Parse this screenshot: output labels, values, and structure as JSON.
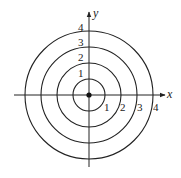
{
  "figure": {
    "axes": {
      "x_label": "x",
      "y_label": "y"
    },
    "circles": [
      {
        "radius": 1,
        "top_label": "1",
        "right_label": "1"
      },
      {
        "radius": 2,
        "top_label": "2",
        "right_label": "2"
      },
      {
        "radius": 3,
        "top_label": "3",
        "right_label": "3"
      },
      {
        "radius": 4,
        "top_label": "4",
        "right_label": "4"
      }
    ],
    "origin_point": true,
    "colors": {
      "stroke": "#222222",
      "background": "#ffffff"
    }
  }
}
